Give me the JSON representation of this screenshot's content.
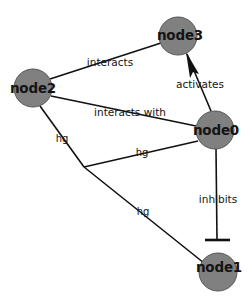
{
  "canvas": {
    "width": 252,
    "height": 298,
    "background": "#ffffff"
  },
  "style": {
    "node_fill": "#808080",
    "node_stroke": "#555555",
    "edge_color": "#111111",
    "label_color": "#141414",
    "node_radius": 19
  },
  "nodes": [
    {
      "id": "node3",
      "label": "node3",
      "x": 178,
      "y": 36,
      "r": 19,
      "label_x": 180,
      "label_y": 36
    },
    {
      "id": "node2",
      "label": "node2",
      "x": 33,
      "y": 88,
      "r": 19,
      "label_x": 33,
      "label_y": 89
    },
    {
      "id": "node0",
      "label": "node0",
      "x": 215,
      "y": 130,
      "r": 19,
      "label_x": 216,
      "label_y": 131
    },
    {
      "id": "node1",
      "label": "node1",
      "x": 218,
      "y": 272,
      "r": 19,
      "label_x": 219,
      "label_y": 268
    }
  ],
  "edges": [
    {
      "id": "edge-node2-node3",
      "source": "node2",
      "target": "node3",
      "label": "interacts",
      "label_x": 110,
      "label_y": 62,
      "arrow": "none",
      "path": "M 50 79 L 161 43"
    },
    {
      "id": "edge-node0-node3",
      "source": "node0",
      "target": "node3",
      "label": "activates",
      "label_x": 200,
      "label_y": 84,
      "arrow": "arrowhead",
      "path": "M 211 111 L 187 54"
    },
    {
      "id": "edge-node2-node0",
      "source": "node2",
      "target": "node0",
      "label": "interacts with",
      "label_x": 130,
      "label_y": 112,
      "arrow": "none",
      "path": "M 51 96 L 196 126"
    },
    {
      "id": "edge-node2-junction",
      "source": "node2",
      "target": "junction",
      "label": "hg",
      "label_x": 62,
      "label_y": 139,
      "arrow": "none",
      "path": "M 40 106 L 84 167"
    },
    {
      "id": "edge-node0-junction",
      "source": "node0",
      "target": "junction",
      "label": "hg",
      "label_x": 142,
      "label_y": 153,
      "arrow": "none",
      "path": "M 198 141 L 84 167"
    },
    {
      "id": "edge-junction-node1",
      "source": "junction",
      "target": "node1",
      "label": "hg",
      "label_x": 143,
      "label_y": 212,
      "arrow": "none",
      "path": "M 84 167 L 204 263"
    },
    {
      "id": "edge-node0-node1",
      "source": "node0",
      "target": "node1",
      "label": "inhibits",
      "label_x": 218,
      "label_y": 199,
      "arrow": "tee",
      "path": "M 216 149 L 217 240"
    }
  ],
  "arrowheads": {
    "activates": {
      "points": "186,52 199,74 193,72 190,78"
    }
  },
  "terminators": {
    "inhibits_tee": {
      "x1": 205,
      "y1": 240,
      "x2": 230,
      "y2": 240
    }
  }
}
